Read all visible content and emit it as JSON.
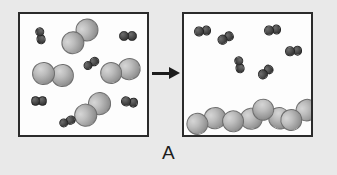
{
  "figure": {
    "caption": "A",
    "background_color": "#e9e9e9",
    "panel_fill": "#fdfdfd",
    "panel_border_color": "#2b2b2b"
  },
  "arrow": {
    "name": "reaction-arrow",
    "direction": "right",
    "color": "#1c1c1c"
  },
  "legend": {
    "large_particle_label": "large light-gray diatomic molecule",
    "small_particle_label": "small dark diatomic molecule",
    "large_color": "#a8a8a8",
    "small_color": "#3e3e3e"
  },
  "panels": [
    {
      "id": "left",
      "name": "before-panel",
      "label": "before",
      "x": 18,
      "y": 12,
      "w": 131,
      "h": 125,
      "molecules": [
        {
          "kind": "small",
          "cx": 20,
          "cy": 22,
          "angle": 80,
          "r": 4.6
        },
        {
          "kind": "large",
          "cx": 60,
          "cy": 22,
          "angle": -42,
          "r": 11.5
        },
        {
          "kind": "small",
          "cx": 108,
          "cy": 22,
          "angle": 0,
          "r": 4.8
        },
        {
          "kind": "small",
          "cx": 71,
          "cy": 50,
          "angle": -32,
          "r": 4.6
        },
        {
          "kind": "large",
          "cx": 33,
          "cy": 60,
          "angle": 6,
          "r": 11.5
        },
        {
          "kind": "large",
          "cx": 100,
          "cy": 57,
          "angle": -12,
          "r": 11.2
        },
        {
          "kind": "small",
          "cx": 19,
          "cy": 87,
          "angle": 0,
          "r": 4.6
        },
        {
          "kind": "small",
          "cx": 110,
          "cy": 88,
          "angle": 10,
          "r": 4.8
        },
        {
          "kind": "large",
          "cx": 72,
          "cy": 95,
          "angle": -40,
          "r": 11.3
        },
        {
          "kind": "small",
          "cx": 47,
          "cy": 108,
          "angle": -22,
          "r": 4.6
        }
      ]
    },
    {
      "id": "right",
      "name": "after-panel",
      "label": "after",
      "x": 182,
      "y": 12,
      "w": 131,
      "h": 125,
      "molecules": [
        {
          "kind": "small",
          "cx": 19,
          "cy": 17,
          "angle": -8,
          "r": 4.8
        },
        {
          "kind": "small",
          "cx": 42,
          "cy": 24,
          "angle": -28,
          "r": 4.8
        },
        {
          "kind": "small",
          "cx": 89,
          "cy": 16,
          "angle": -8,
          "r": 4.8
        },
        {
          "kind": "small",
          "cx": 110,
          "cy": 37,
          "angle": -5,
          "r": 4.8
        },
        {
          "kind": "small",
          "cx": 55,
          "cy": 51,
          "angle": 80,
          "r": 4.6
        },
        {
          "kind": "small",
          "cx": 82,
          "cy": 58,
          "angle": -40,
          "r": 4.8
        },
        {
          "kind": "large",
          "cx": 22,
          "cy": 107,
          "angle": -18,
          "r": 11.2
        },
        {
          "kind": "large",
          "cx": 58,
          "cy": 106,
          "angle": -8,
          "r": 11.2
        },
        {
          "kind": "large",
          "cx": 87,
          "cy": 100,
          "angle": 28,
          "r": 11.2
        },
        {
          "kind": "large",
          "cx": 115,
          "cy": 101,
          "angle": -32,
          "r": 11.2
        }
      ]
    }
  ],
  "chart_data": {
    "type": "diagram",
    "title": "A",
    "panels": [
      {
        "label": "before",
        "large_molecule_count": 4,
        "small_molecule_count": 6,
        "large_molecule_state": "gas",
        "small_molecule_state": "gas"
      },
      {
        "label": "after",
        "large_molecule_count": 4,
        "small_molecule_count": 6,
        "large_molecule_state": "liquid",
        "small_molecule_state": "gas"
      }
    ]
  }
}
